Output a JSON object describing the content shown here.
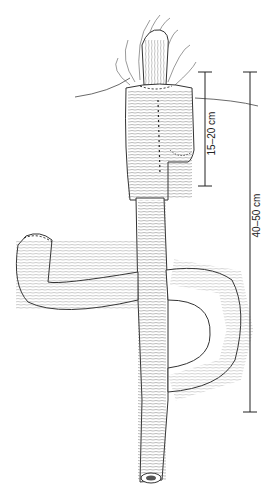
{
  "figure": {
    "style": "pencil line drawing, grayscale",
    "ink_color": "#3a3a3a"
  },
  "measurements": [
    {
      "label": "15–20 cm",
      "orientation": "vertical"
    },
    {
      "label": "40–50 cm",
      "orientation": "vertical"
    }
  ]
}
